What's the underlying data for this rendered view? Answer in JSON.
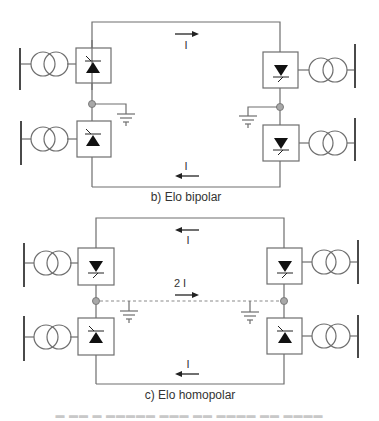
{
  "diagrams": [
    {
      "id": "bipolar",
      "caption": "b) Elo bipolar",
      "current_top": "I",
      "current_bottom": "I",
      "top_arrow_direction": "right",
      "bottom_arrow_direction": "left",
      "grounded_midpoints": true
    },
    {
      "id": "homopolar",
      "caption": "c) Elo homopolar",
      "current_top": "I",
      "current_middle": "2 I",
      "current_bottom": "I",
      "top_arrow_direction": "left",
      "middle_arrow_direction": "right",
      "bottom_arrow_direction": "left",
      "grounded_midpoints": true,
      "return_path": "dashed"
    }
  ],
  "colors": {
    "wire": "#6e6e6e",
    "node": "#a8a8a8",
    "thyristor": "#111111"
  }
}
